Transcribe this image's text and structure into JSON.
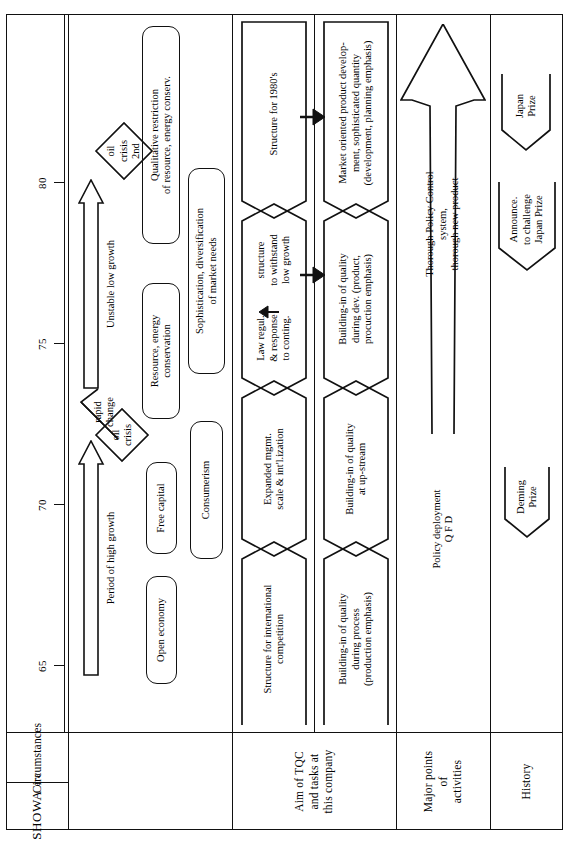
{
  "diagram": {
    "axis": {
      "ticks": [
        "65",
        "70",
        "75",
        "80"
      ]
    },
    "row_labels": {
      "era": {
        "main": "SHOWA",
        "sub": "era"
      },
      "circumstances": "Circumstances",
      "aim_of_tqc": "Aim of TQC\nand tasks at\nthis company",
      "major_points": "Major points\nof\nactivities",
      "history": "History"
    },
    "circumstances": {
      "eras": [
        {
          "label": "Period of high growth"
        },
        {
          "label": "Unstable low growth"
        }
      ],
      "shocks": [
        {
          "label": "oil\ncrisis"
        },
        {
          "label": "oil\ncrisis\n2nd"
        }
      ],
      "rapid_change": "rapid\nchange",
      "band_a": [
        {
          "label": "Open economy"
        },
        {
          "label": "Free capital"
        },
        {
          "label": "Resource, energy\nconservation"
        },
        {
          "label": "Qualitative restriction\nof resource, energy conserv."
        }
      ],
      "band_b": [
        {
          "label": "Consumerism"
        },
        {
          "label": "Sophistication, diversification\nof market needs"
        }
      ]
    },
    "aim_of_tqc": {
      "upper": [
        {
          "label": "Structure for international\ncompetition"
        },
        {
          "label": "Expanded mgmt.\nscale & int'l.ization"
        },
        {
          "label": "Law regul.\n& response\nto conting."
        },
        {
          "label": "structure\nto withstand\nlow growth"
        },
        {
          "label": "Structure for 1980's"
        }
      ],
      "lower": [
        {
          "label": "Building-in of quality\nduring process\n(production emphasis)"
        },
        {
          "label": "Building-in of quality\nat up-stream"
        },
        {
          "label": "Building-in of quality\nduring dev. (product,\nprocuction emphasis)"
        },
        {
          "label": "Market oriented product develop-\nment, sophisticated quantity\n(development, planning emphasis)"
        }
      ]
    },
    "major_points": {
      "shaft_label": "Policy deployment\nQ F D",
      "head_label": "Thorough Policy Control system,\nthorough new product"
    },
    "history": {
      "milestones": [
        {
          "label": "Deming\nPrize"
        },
        {
          "label": "Announce.\nto challenge\nJapan Prize"
        },
        {
          "label": "Japan\nPrize"
        }
      ]
    }
  }
}
